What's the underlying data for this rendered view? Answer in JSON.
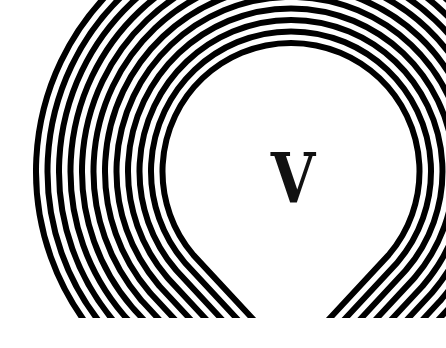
{
  "image": {
    "description": "Concentric black and white teardrop-shaped stripes surrounding a central white area containing a serif letter",
    "center_letter": "V",
    "colors": {
      "stripe": "#000000",
      "background": "#ffffff",
      "letter": "#111111"
    },
    "stripe_count": 12
  }
}
